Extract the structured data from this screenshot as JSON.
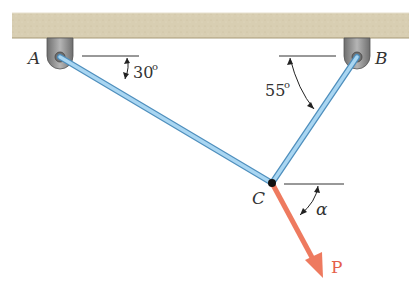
{
  "diagram": {
    "type": "statics-two-cable-support",
    "colors": {
      "ceiling": "#d9cfb4",
      "ceiling_edge": "#b8ab8a",
      "bracket": "#8e8e8e",
      "cable": "#8fc6e8",
      "cable_edge": "#4f8fbd",
      "force": "#ee7a5f",
      "line": "#333333"
    },
    "points": {
      "A": {
        "label": "A",
        "x": 60,
        "y": 57
      },
      "B": {
        "label": "B",
        "x": 357,
        "y": 57
      },
      "C": {
        "label": "C",
        "x": 272,
        "y": 183
      }
    },
    "members": [
      {
        "from": "A",
        "to": "C",
        "name": "cable-AC"
      },
      {
        "from": "B",
        "to": "C",
        "name": "cable-BC"
      }
    ],
    "angles": [
      {
        "at": "A",
        "value": "30°",
        "label": "30"
      },
      {
        "at": "B",
        "value": "55°",
        "label": "55"
      },
      {
        "at": "C",
        "value": "α",
        "label": "α"
      }
    ],
    "force": {
      "label": "P",
      "from": "C",
      "tip": {
        "x": 323,
        "y": 278
      }
    }
  }
}
